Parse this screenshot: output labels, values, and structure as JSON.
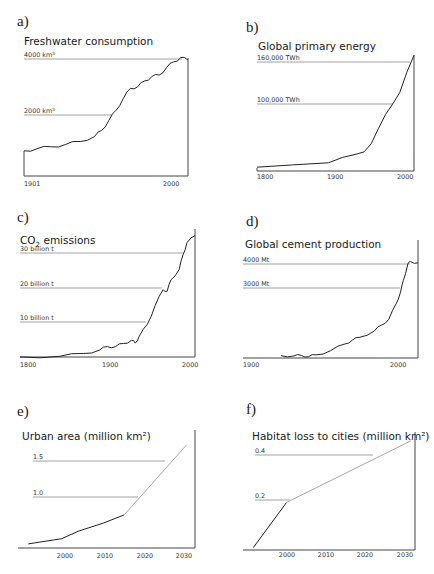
{
  "chart_data": [
    {
      "id": "a",
      "panel_label": "a)",
      "type": "line",
      "title": "Freshwater consumption",
      "xlabel": "",
      "ylabel": "",
      "x_ticks": [
        "1901",
        "2000"
      ],
      "reference_lines": [
        {
          "label": "4000 km³",
          "value": 4000
        },
        {
          "label": "2000 km³",
          "value": 2000
        }
      ],
      "xlim": [
        1901,
        2015
      ],
      "ylim": [
        0,
        4000
      ],
      "x": [
        1901,
        1910,
        1920,
        1930,
        1940,
        1950,
        1955,
        1960,
        1965,
        1970,
        1975,
        1980,
        1985,
        1990,
        1995,
        2000,
        2005,
        2010,
        2015
      ],
      "values": [
        860,
        930,
        1000,
        1080,
        1180,
        1350,
        1560,
        1900,
        2250,
        2650,
        3000,
        3050,
        3250,
        3400,
        3450,
        3700,
        3900,
        4050,
        3960
      ],
      "grid": false
    },
    {
      "id": "b",
      "panel_label": "b)",
      "type": "line",
      "title": "Global primary energy",
      "x_ticks": [
        "1800",
        "1900",
        "2000"
      ],
      "reference_lines": [
        {
          "label": "160,000 TWh",
          "value": 160000
        },
        {
          "label": "100,000 TWh",
          "value": 100000
        }
      ],
      "xlim": [
        1800,
        2020
      ],
      "ylim": [
        0,
        170000
      ],
      "x": [
        1800,
        1850,
        1900,
        1920,
        1940,
        1950,
        1960,
        1970,
        1980,
        1990,
        2000,
        2010,
        2020
      ],
      "values": [
        5600,
        9000,
        12000,
        20000,
        25000,
        28000,
        40000,
        62000,
        83000,
        98000,
        115000,
        145000,
        170000
      ],
      "grid": false
    },
    {
      "id": "c",
      "panel_label": "c)",
      "type": "line",
      "title": "CO₂ emissions",
      "title_parts": {
        "main": "CO",
        "sub": "2",
        "rest": " emissions"
      },
      "x_ticks": [
        "1800",
        "1900",
        "2000"
      ],
      "reference_lines": [
        {
          "label": "30 billion t",
          "value": 30
        },
        {
          "label": "20 billion t",
          "value": 20
        },
        {
          "label": "10 billion t",
          "value": 10
        }
      ],
      "xlim": [
        1800,
        2020
      ],
      "ylim": [
        0,
        36
      ],
      "x": [
        1800,
        1850,
        1880,
        1900,
        1910,
        1920,
        1930,
        1940,
        1945,
        1950,
        1960,
        1970,
        1980,
        1985,
        1990,
        2000,
        2005,
        2010,
        2020
      ],
      "values": [
        0.03,
        0.2,
        1.0,
        2.0,
        3.0,
        3.0,
        3.9,
        4.8,
        4.0,
        6.0,
        9.4,
        14.9,
        19.4,
        19.0,
        22.3,
        25.2,
        29.5,
        33.0,
        35.0
      ],
      "grid": false
    },
    {
      "id": "d",
      "panel_label": "d)",
      "type": "line",
      "title": "Global cement production",
      "x_ticks": [
        "1900",
        "2000"
      ],
      "reference_lines": [
        {
          "label": "4000 Mt",
          "value": 4000
        },
        {
          "label": "3000 Mt",
          "value": 3000
        }
      ],
      "xlim": [
        1900,
        2020
      ],
      "ylim": [
        0,
        4200
      ],
      "x": [
        1926,
        1935,
        1940,
        1945,
        1950,
        1960,
        1970,
        1975,
        1980,
        1990,
        1995,
        2000,
        2005,
        2008,
        2010,
        2013,
        2015,
        2020
      ],
      "values": [
        100,
        90,
        110,
        60,
        130,
        310,
        600,
        760,
        880,
        1150,
        1400,
        1650,
        2300,
        2800,
        3300,
        4000,
        4100,
        4050
      ],
      "grid": false
    },
    {
      "id": "e",
      "panel_label": "e)",
      "type": "line",
      "title": "Urban area (million km²)",
      "x_ticks": [
        "2000",
        "2010",
        "2020",
        "2030"
      ],
      "reference_lines": [
        {
          "label": "1.5",
          "value": 1.5
        },
        {
          "label": "1.0",
          "value": 1.0
        }
      ],
      "xlim": [
        1990,
        2032
      ],
      "ylim": [
        0,
        1.9
      ],
      "series": [
        {
          "name": "observed",
          "x": [
            1992,
            2000,
            2004,
            2010,
            2015
          ],
          "values": [
            0.07,
            0.16,
            0.29,
            0.43,
            0.57
          ]
        },
        {
          "name": "projected",
          "x": [
            2015,
            2030
          ],
          "values": [
            0.57,
            1.78
          ]
        }
      ],
      "grid": false
    },
    {
      "id": "f",
      "panel_label": "f)",
      "type": "line",
      "title": "Habitat loss to cities (million km²)",
      "x_ticks": [
        "2000",
        "2010",
        "2020",
        "2030"
      ],
      "reference_lines": [
        {
          "label": "0.4",
          "value": 0.4
        },
        {
          "label": "0.2",
          "value": 0.2
        }
      ],
      "xlim": [
        1990,
        2031
      ],
      "ylim": [
        0,
        0.48
      ],
      "series": [
        {
          "name": "observed",
          "x": [
            1992,
            2000
          ],
          "values": [
            0.01,
            0.2
          ]
        },
        {
          "name": "projected",
          "x": [
            2000,
            2030
          ],
          "values": [
            0.2,
            0.46
          ]
        }
      ],
      "grid": false
    }
  ],
  "layout": {
    "panels": [
      {
        "id": "a",
        "letter_xy": [
          17,
          26
        ],
        "title_xy": [
          24,
          45
        ],
        "plot": {
          "x0": 24,
          "x1": 188,
          "y_base": 176,
          "y_top": 58,
          "axis_right": true,
          "axis_right_top": 58
        },
        "tick_y": 186,
        "tick_x": [
          {
            "t": "1901",
            "x": 24
          },
          {
            "t": "2000",
            "x": 163
          }
        ],
        "ref": [
          {
            "y": 59,
            "lx": 24,
            "x1": 182
          },
          {
            "y": 115,
            "lx": 24,
            "x1": 112
          }
        ],
        "x_range": [
          1901,
          2015
        ],
        "y_range": [
          0,
          4000
        ]
      },
      {
        "id": "b",
        "letter_xy": [
          246,
          32
        ],
        "title_xy": [
          258,
          50
        ],
        "plot": {
          "x0": 257,
          "x1": 414,
          "y_base": 171,
          "y_top": 55,
          "axis_right": true,
          "axis_right_top": 55
        },
        "tick_y": 179,
        "tick_x": [
          {
            "t": "1800",
            "x": 257
          },
          {
            "t": "1900",
            "x": 327
          },
          {
            "t": "2000",
            "x": 397
          }
        ],
        "ref": [
          {
            "y": 62,
            "lx": 257,
            "x1": 410
          },
          {
            "y": 104,
            "lx": 257,
            "x1": 393
          }
        ],
        "x_range": [
          1800,
          2020
        ],
        "y_range": [
          0,
          170000
        ]
      },
      {
        "id": "c",
        "letter_xy": [
          17,
          222
        ],
        "title_xy": [
          20,
          244
        ],
        "plot": {
          "x0": 20,
          "x1": 195,
          "y_base": 357,
          "y_top": 229,
          "axis_right": true,
          "axis_right_top": 229
        },
        "tick_y": 367,
        "tick_x": [
          {
            "t": "1800",
            "x": 20
          },
          {
            "t": "1900",
            "x": 102
          },
          {
            "t": "2000",
            "x": 182
          }
        ],
        "ref": [
          {
            "y": 253,
            "lx": 20,
            "x1": 184
          },
          {
            "y": 288,
            "lx": 20,
            "x1": 162
          },
          {
            "y": 322,
            "lx": 20,
            "x1": 146
          }
        ],
        "x_range": [
          1800,
          2020
        ],
        "y_range": [
          0,
          36
        ]
      },
      {
        "id": "d",
        "letter_xy": [
          246,
          226
        ],
        "title_xy": [
          245,
          248
        ],
        "plot": {
          "x0": 243,
          "x1": 418,
          "y_base": 358,
          "y_top": 240,
          "axis_right": true,
          "axis_right_top": 240
        },
        "tick_y": 367,
        "tick_x": [
          {
            "t": "1900",
            "x": 243
          },
          {
            "t": "2000",
            "x": 390
          }
        ],
        "ref": [
          {
            "y": 264,
            "lx": 243,
            "x1": 410
          },
          {
            "y": 288,
            "lx": 243,
            "x1": 400
          }
        ],
        "x_range": [
          1900,
          2020
        ],
        "y_range": [
          0,
          4200
        ]
      },
      {
        "id": "e",
        "letter_xy": [
          17,
          416
        ],
        "title_xy": [
          22,
          440
        ],
        "plot": {
          "x0": 20,
          "x1": 195,
          "y_base": 548,
          "y_top": 430,
          "axis_right": true,
          "axis_right_top": 430
        },
        "tick_y": 558,
        "tick_x": [
          {
            "t": "2000",
            "x": 65
          },
          {
            "t": "2010",
            "x": 105
          },
          {
            "t": "2020",
            "x": 145
          },
          {
            "t": "2030",
            "x": 184
          }
        ],
        "ref": [
          {
            "y": 461,
            "lx": 33,
            "x1": 165
          },
          {
            "y": 497,
            "lx": 33,
            "x1": 138
          }
        ],
        "x_range": [
          1990,
          2032
        ],
        "y_range": [
          0,
          1.9
        ]
      },
      {
        "id": "f",
        "letter_xy": [
          246,
          414
        ],
        "title_xy": [
          252,
          440
        ],
        "plot": {
          "x0": 245,
          "x1": 415,
          "y_base": 550,
          "y_top": 432,
          "axis_right": true,
          "axis_right_top": 432
        },
        "tick_y": 557,
        "tick_x": [
          {
            "t": "2000",
            "x": 287
          },
          {
            "t": "2010",
            "x": 326
          },
          {
            "t": "2020",
            "x": 365
          },
          {
            "t": "2030",
            "x": 405
          }
        ],
        "ref": [
          {
            "y": 455,
            "lx": 255,
            "x1": 373
          },
          {
            "y": 500,
            "lx": 255,
            "x1": 290
          }
        ],
        "x_range": [
          1990,
          2031
        ],
        "y_range": [
          0,
          0.48
        ]
      }
    ]
  }
}
